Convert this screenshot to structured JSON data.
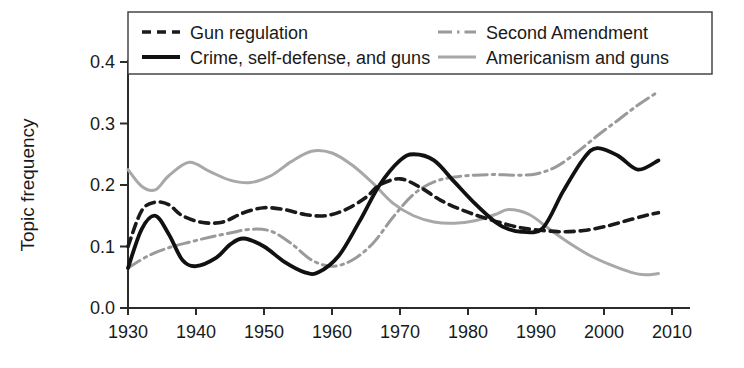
{
  "chart_data": {
    "type": "line",
    "title": "",
    "xlabel": "",
    "ylabel": "Topic frequency",
    "xlim": [
      1930,
      2010
    ],
    "ylim": [
      0.0,
      0.4
    ],
    "xticks": [
      1930,
      1940,
      1950,
      1960,
      1970,
      1980,
      1990,
      2000,
      2010
    ],
    "yticks": [
      "0.0",
      "0.1",
      "0.2",
      "0.3",
      "0.4"
    ],
    "grid": false,
    "legend_position": "top",
    "series": [
      {
        "name": "Gun regulation",
        "style": "dashed",
        "color": "#1a1a1a",
        "width": 3.6,
        "dash": "9,6",
        "x": [
          1930,
          1932,
          1934,
          1936,
          1938,
          1941,
          1944,
          1947,
          1950,
          1953,
          1956,
          1959,
          1962,
          1965,
          1967,
          1970,
          1973,
          1976,
          1979,
          1982,
          1985,
          1988,
          1991,
          1994,
          1997,
          2000,
          2003,
          2006,
          2008
        ],
        "y": [
          0.1,
          0.158,
          0.172,
          0.168,
          0.15,
          0.139,
          0.14,
          0.155,
          0.163,
          0.16,
          0.152,
          0.15,
          0.16,
          0.18,
          0.2,
          0.21,
          0.196,
          0.175,
          0.16,
          0.148,
          0.138,
          0.13,
          0.126,
          0.124,
          0.126,
          0.132,
          0.141,
          0.15,
          0.155
        ]
      },
      {
        "name": "Crime, self-defense, and guns",
        "style": "solid",
        "color": "#111111",
        "width": 3.8,
        "dash": "",
        "x": [
          1930,
          1932,
          1934,
          1936,
          1938,
          1940,
          1943,
          1945,
          1947,
          1950,
          1953,
          1956,
          1958,
          1961,
          1964,
          1967,
          1970,
          1972,
          1975,
          1978,
          1981,
          1984,
          1986,
          1988,
          1991,
          1994,
          1997,
          1999,
          2002,
          2005,
          2008
        ],
        "y": [
          0.065,
          0.128,
          0.15,
          0.12,
          0.078,
          0.068,
          0.082,
          0.103,
          0.113,
          0.1,
          0.075,
          0.058,
          0.058,
          0.085,
          0.14,
          0.2,
          0.24,
          0.25,
          0.24,
          0.205,
          0.17,
          0.14,
          0.128,
          0.124,
          0.13,
          0.19,
          0.243,
          0.26,
          0.248,
          0.225,
          0.24
        ]
      },
      {
        "name": "Second Amendment",
        "style": "dashdot",
        "color": "#9a9a9a",
        "width": 3.0,
        "dash": "14,5,2.5,5",
        "x": [
          1930,
          1933,
          1936,
          1939,
          1942,
          1945,
          1948,
          1951,
          1954,
          1957,
          1960,
          1963,
          1966,
          1969,
          1972,
          1975,
          1978,
          1981,
          1984,
          1987,
          1990,
          1993,
          1996,
          1999,
          2002,
          2005,
          2008
        ],
        "y": [
          0.065,
          0.085,
          0.098,
          0.107,
          0.115,
          0.122,
          0.128,
          0.125,
          0.105,
          0.078,
          0.068,
          0.078,
          0.105,
          0.148,
          0.185,
          0.205,
          0.213,
          0.216,
          0.217,
          0.216,
          0.218,
          0.23,
          0.253,
          0.28,
          0.305,
          0.33,
          0.352
        ]
      },
      {
        "name": "Americanism and guns",
        "style": "solid-light",
        "color": "#a8a8a8",
        "width": 3.0,
        "dash": "",
        "x": [
          1930,
          1932,
          1934,
          1936,
          1939,
          1942,
          1945,
          1948,
          1951,
          1954,
          1957,
          1960,
          1963,
          1966,
          1969,
          1972,
          1975,
          1978,
          1981,
          1984,
          1986,
          1989,
          1992,
          1995,
          1998,
          2001,
          2004,
          2006,
          2008
        ],
        "y": [
          0.225,
          0.198,
          0.192,
          0.215,
          0.237,
          0.222,
          0.208,
          0.204,
          0.215,
          0.238,
          0.255,
          0.252,
          0.232,
          0.203,
          0.17,
          0.15,
          0.14,
          0.138,
          0.142,
          0.152,
          0.16,
          0.152,
          0.128,
          0.105,
          0.085,
          0.07,
          0.058,
          0.054,
          0.056
        ]
      }
    ]
  },
  "legend": {
    "entries": [
      {
        "label": "Gun regulation"
      },
      {
        "label": "Second Amendment"
      },
      {
        "label": "Crime, self-defense, and guns"
      },
      {
        "label": "Americanism and guns"
      }
    ]
  }
}
